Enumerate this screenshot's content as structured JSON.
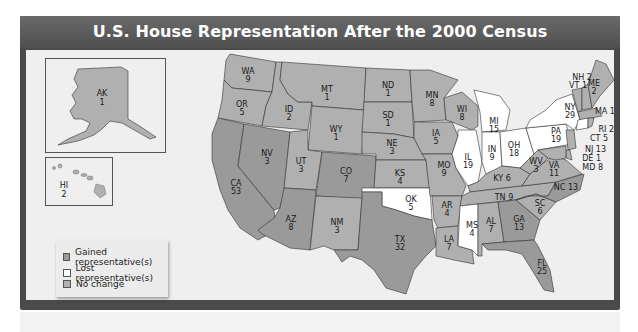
{
  "title": "U.S. House Representation After the 2000 Census",
  "colors": {
    "gained": "#9a9a9a",
    "lost": "#ffffff",
    "no_change": "#b0b0b0",
    "frame": "#4a4a4a",
    "background": "#efefef",
    "water": "#c4c4c4"
  },
  "legend": {
    "items": [
      {
        "label": "Gained representative(s)",
        "status": "gained"
      },
      {
        "label": "Lost representative(s)",
        "status": "lost"
      },
      {
        "label": "No change",
        "status": "no_change"
      }
    ]
  },
  "insets": {
    "alaska": {
      "abbr": "AK",
      "seats": "1"
    },
    "hawaii": {
      "abbr": "HI",
      "seats": "2"
    }
  },
  "states": [
    {
      "abbr": "WA",
      "seats": "9",
      "status": "no_change"
    },
    {
      "abbr": "OR",
      "seats": "5",
      "status": "no_change"
    },
    {
      "abbr": "CA",
      "seats": "53",
      "status": "gained"
    },
    {
      "abbr": "ID",
      "seats": "2",
      "status": "no_change"
    },
    {
      "abbr": "NV",
      "seats": "3",
      "status": "gained"
    },
    {
      "abbr": "MT",
      "seats": "1",
      "status": "no_change"
    },
    {
      "abbr": "WY",
      "seats": "1",
      "status": "no_change"
    },
    {
      "abbr": "UT",
      "seats": "3",
      "status": "no_change"
    },
    {
      "abbr": "AZ",
      "seats": "8",
      "status": "gained"
    },
    {
      "abbr": "CO",
      "seats": "7",
      "status": "gained"
    },
    {
      "abbr": "NM",
      "seats": "3",
      "status": "no_change"
    },
    {
      "abbr": "ND",
      "seats": "1",
      "status": "no_change"
    },
    {
      "abbr": "SD",
      "seats": "1",
      "status": "no_change"
    },
    {
      "abbr": "NE",
      "seats": "3",
      "status": "no_change"
    },
    {
      "abbr": "KS",
      "seats": "4",
      "status": "no_change"
    },
    {
      "abbr": "OK",
      "seats": "5",
      "status": "lost"
    },
    {
      "abbr": "TX",
      "seats": "32",
      "status": "gained"
    },
    {
      "abbr": "MN",
      "seats": "8",
      "status": "no_change"
    },
    {
      "abbr": "IA",
      "seats": "5",
      "status": "no_change"
    },
    {
      "abbr": "MO",
      "seats": "9",
      "status": "no_change"
    },
    {
      "abbr": "AR",
      "seats": "4",
      "status": "no_change"
    },
    {
      "abbr": "LA",
      "seats": "7",
      "status": "no_change"
    },
    {
      "abbr": "WI",
      "seats": "8",
      "status": "no_change"
    },
    {
      "abbr": "IL",
      "seats": "19",
      "status": "lost"
    },
    {
      "abbr": "MI",
      "seats": "15",
      "status": "lost"
    },
    {
      "abbr": "IN",
      "seats": "9",
      "status": "lost"
    },
    {
      "abbr": "OH",
      "seats": "18",
      "status": "lost"
    },
    {
      "abbr": "KY",
      "seats": "6",
      "status": "no_change"
    },
    {
      "abbr": "TN",
      "seats": "9",
      "status": "no_change"
    },
    {
      "abbr": "MS",
      "seats": "4",
      "status": "lost"
    },
    {
      "abbr": "AL",
      "seats": "7",
      "status": "no_change"
    },
    {
      "abbr": "GA",
      "seats": "13",
      "status": "gained"
    },
    {
      "abbr": "FL",
      "seats": "25",
      "status": "gained"
    },
    {
      "abbr": "SC",
      "seats": "6",
      "status": "no_change"
    },
    {
      "abbr": "NC",
      "seats": "13",
      "status": "gained"
    },
    {
      "abbr": "VA",
      "seats": "11",
      "status": "no_change"
    },
    {
      "abbr": "WV",
      "seats": "3",
      "status": "no_change"
    },
    {
      "abbr": "PA",
      "seats": "19",
      "status": "lost"
    },
    {
      "abbr": "NY",
      "seats": "29",
      "status": "lost"
    },
    {
      "abbr": "VT",
      "seats": "1",
      "status": "no_change"
    },
    {
      "abbr": "NH",
      "seats": "2",
      "status": "no_change"
    },
    {
      "abbr": "ME",
      "seats": "2",
      "status": "no_change"
    },
    {
      "abbr": "MA",
      "seats": "10",
      "status": "no_change"
    },
    {
      "abbr": "RI",
      "seats": "2",
      "status": "no_change"
    },
    {
      "abbr": "CT",
      "seats": "5",
      "status": "lost"
    },
    {
      "abbr": "NJ",
      "seats": "13",
      "status": "no_change"
    },
    {
      "abbr": "DE",
      "seats": "1",
      "status": "no_change"
    },
    {
      "abbr": "MD",
      "seats": "8",
      "status": "no_change"
    }
  ],
  "callout_labels": {
    "NH": "NH 2",
    "VT": "VT 1",
    "MA": "MA 10",
    "RI": "RI 2",
    "CT": "CT 5",
    "NJ": "NJ 13",
    "DE": "DE 1",
    "MD": "MD 8",
    "KY": "KY 6",
    "TN": "TN 9",
    "NC": "NC 13"
  }
}
